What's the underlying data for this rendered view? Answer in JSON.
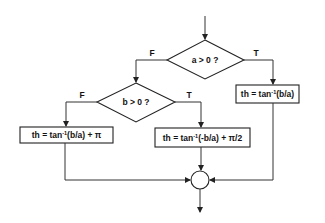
{
  "diagram": {
    "type": "flowchart",
    "decisions": [
      {
        "id": "d1",
        "label": "a > 0 ?",
        "true_label": "T",
        "false_label": "F"
      },
      {
        "id": "d2",
        "label": "b > 0 ?",
        "true_label": "T",
        "false_label": "F"
      }
    ],
    "processes": [
      {
        "id": "p_a_pos",
        "pre": "th = tan",
        "sup": "-1",
        "post": "(b/a)"
      },
      {
        "id": "p_b_neg",
        "pre": "th = tan",
        "sup": "-1",
        "post": "(b/a) + π"
      },
      {
        "id": "p_b_pos",
        "pre": "th = tan",
        "sup": "-1",
        "post": "(-b/a) + π/2"
      }
    ],
    "edges": [
      {
        "from": "start",
        "to": "d1"
      },
      {
        "from": "d1",
        "to": "p_a_pos",
        "label": "T"
      },
      {
        "from": "d1",
        "to": "d2",
        "label": "F"
      },
      {
        "from": "d2",
        "to": "p_b_pos",
        "label": "T"
      },
      {
        "from": "d2",
        "to": "p_b_neg",
        "label": "F"
      },
      {
        "from": "p_b_neg",
        "to": "join"
      },
      {
        "from": "p_b_pos",
        "to": "join"
      },
      {
        "from": "p_a_pos",
        "to": "join"
      },
      {
        "from": "join",
        "to": "end"
      }
    ]
  }
}
